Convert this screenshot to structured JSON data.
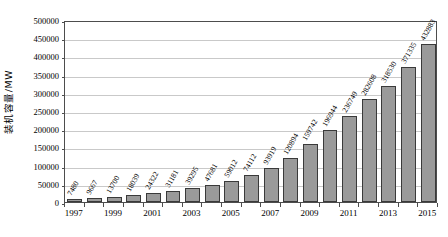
{
  "chart_data": {
    "type": "bar",
    "title": "",
    "xlabel": "",
    "ylabel": "装机容量/MW",
    "ylim": [
      0,
      500000
    ],
    "ytick_step": 50000,
    "grid": true,
    "legend": "none",
    "xtick_interval": 2,
    "bar_color": "#9a9a9a",
    "bar_edge_color": "#3a3a3a",
    "grid_color": "#c9c9c9",
    "axis_color": "#4d4d4d",
    "background_color": "#ffffff",
    "data_label_rotation_deg": -60,
    "categories": [
      "1997",
      "1998",
      "1999",
      "2000",
      "2001",
      "2002",
      "2003",
      "2004",
      "2005",
      "2006",
      "2007",
      "2008",
      "2009",
      "2010",
      "2011",
      "2012",
      "2013",
      "2014",
      "2015"
    ],
    "values": [
      7480,
      9667,
      13700,
      18039,
      24322,
      31181,
      39295,
      47681,
      59012,
      74112,
      93919,
      120894,
      159742,
      196944,
      236749,
      282608,
      318530,
      371335,
      432883
    ],
    "data_labels": [
      "7480",
      "9667",
      "13700",
      "18039",
      "24322",
      "31181",
      "39295",
      "47681",
      "59012",
      "74112",
      "93919",
      "120894",
      "159742",
      "196944",
      "236749",
      "282608",
      "318530",
      "371335",
      "432883"
    ],
    "ytick_labels": [
      "0",
      "50000",
      "100000",
      "150000",
      "200000",
      "250000",
      "300000",
      "350000",
      "400000",
      "450000",
      "500000"
    ],
    "ytick_values": [
      0,
      50000,
      100000,
      150000,
      200000,
      250000,
      300000,
      350000,
      400000,
      450000,
      500000
    ],
    "xtick_labels": [
      "1997",
      "1999",
      "2001",
      "2003",
      "2005",
      "2007",
      "2009",
      "2011",
      "2013",
      "2015"
    ]
  }
}
